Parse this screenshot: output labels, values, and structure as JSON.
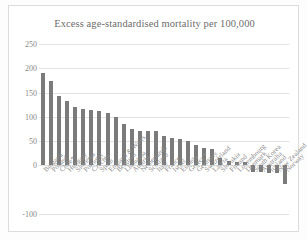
{
  "chart_data": {
    "type": "bar",
    "title": "Excess age-standardised mortality per 100,000",
    "xlabel": "",
    "ylabel": "",
    "ylim": [
      -100,
      250
    ],
    "yticks": [
      250,
      200,
      150,
      100,
      50,
      0,
      -100
    ],
    "ytick_labels": [
      "250",
      "200",
      "150",
      "100",
      "50",
      "0",
      "-100"
    ],
    "grid": true,
    "legend": "none",
    "bar_color": "#7b7b7b",
    "categories": [
      "Bulgaria",
      "Poland",
      "Chile*",
      "Hungary",
      "Slovenia",
      "Portugal",
      "Czechia",
      "Spain",
      "England & Wales",
      "Belgium",
      "Lithuania",
      "Austria",
      "Netherlands",
      "Scotland",
      "Italy",
      "France",
      "Israel",
      "Estonia",
      "Greece*",
      "Germany",
      "Switzerland",
      "Latvia",
      "Slovakia",
      "Finland",
      "Luxembourg",
      "Denmark",
      "South Korea",
      "Australia",
      "Iceland",
      "New Zealand",
      "Norway"
    ],
    "values": [
      190,
      174,
      143,
      133,
      120,
      116,
      115,
      112,
      108,
      99,
      86,
      74,
      71,
      70,
      70,
      61,
      56,
      55,
      50,
      43,
      36,
      33,
      15,
      9,
      8,
      8,
      -13,
      -14,
      -15,
      -16,
      -38
    ]
  }
}
